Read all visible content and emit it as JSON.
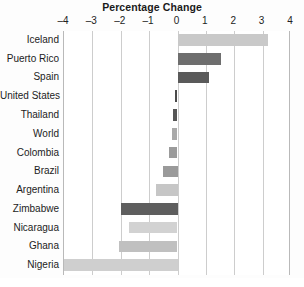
{
  "chart_data": {
    "type": "bar",
    "orientation": "horizontal",
    "title": "Percentage Change",
    "xlabel": "",
    "ylabel": "",
    "xlim": [
      -4,
      4
    ],
    "xticks": [
      -4,
      -3,
      -2,
      -1,
      0,
      1,
      2,
      3,
      4
    ],
    "xtick_labels": [
      "–4",
      "–3",
      "–2",
      "–1",
      "0",
      "1",
      "2",
      "3",
      "4"
    ],
    "grid": true,
    "legend": "none",
    "categories": [
      "Iceland",
      "Puerto Rico",
      "Spain",
      "United States",
      "Thailand",
      "World",
      "Colombia",
      "Brazil",
      "Argentina",
      "Zimbabwe",
      "Nicaragua",
      "Ghana",
      "Nigeria"
    ],
    "values": [
      3.2,
      1.55,
      1.1,
      -0.1,
      -0.15,
      -0.2,
      -0.3,
      -0.5,
      -0.75,
      -2.0,
      -1.7,
      -2.05,
      -4.3
    ],
    "bar_colors": [
      "#c9c9c9",
      "#6e6e6e",
      "#5a5a5a",
      "#4a4a4a",
      "#565656",
      "#a9a9a9",
      "#9b9b9b",
      "#9a9a9a",
      "#c6c6c6",
      "#5e5e5e",
      "#d2d2d2",
      "#c0c0c0",
      "#cfcfcf"
    ],
    "clipped_bars": [
      "Nigeria"
    ]
  },
  "colors": {
    "background": "#ffffff",
    "axis_line": "#b9b9b9",
    "gridline": "#cdcdcd",
    "title_text": "#1a1a1a",
    "label_text": "#1c1c1c"
  }
}
